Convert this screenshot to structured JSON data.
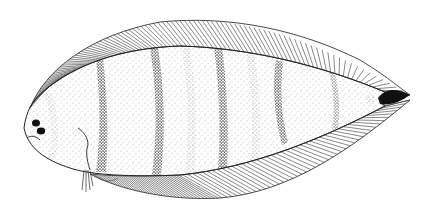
{
  "figure": {
    "description": "Stippled scientific drawing of a flatfish in lateral view, head facing left, with dark vertical cross-bands and a dark-tipped tail",
    "colors": {
      "background": "#ffffff",
      "outline": "#222222",
      "stipple": "#555555",
      "band": "#1a1a1a"
    },
    "bands": {
      "dark": [
        100,
        155,
        218,
        278
      ],
      "faint": [
        50,
        185,
        250,
        333
      ]
    }
  }
}
